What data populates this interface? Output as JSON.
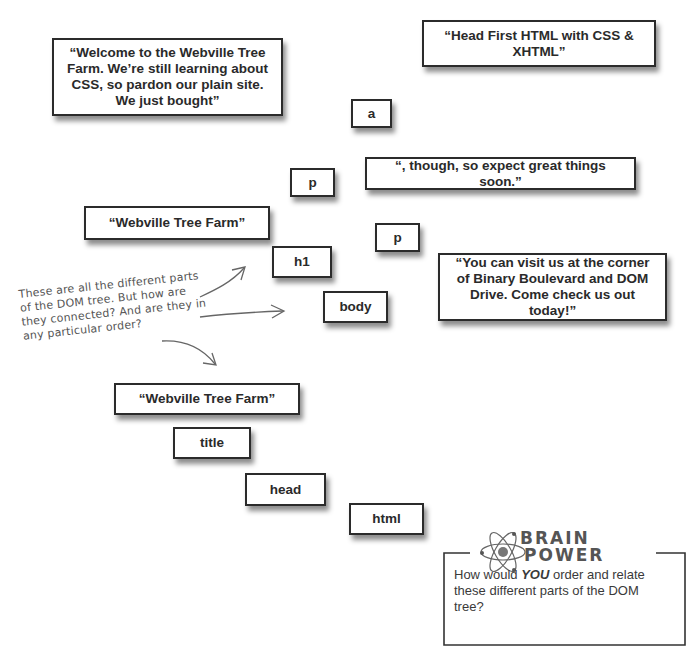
{
  "nodes": {
    "welcome_text": "“Welcome to the Webville Tree Farm. We’re still learning about CSS, so pardon our plain site. We just bought”",
    "book_text": "“Head First HTML with CSS & XHTML”",
    "a": "a",
    "though_text": "“, though, so expect great things soon.”",
    "p1": "p",
    "heading_text": "“Webville Tree Farm”",
    "p2": "p",
    "h1": "h1",
    "body": "body",
    "visit_text": "“You can visit us at the corner of Binary Boulevard and DOM Drive. Come check us out today!”",
    "title_text": "“Webville Tree Farm”",
    "title": "title",
    "head": "head",
    "html": "html"
  },
  "annotation": {
    "line1": "These are all the different parts",
    "line2": "of the DOM tree. But how are",
    "line3": "they connected? And are they in",
    "line4": "any particular order?"
  },
  "brain_power": {
    "title_line1": "BRAIN",
    "title_line2": "POWER",
    "icon": "atom-icon",
    "text_before": "How would ",
    "text_emph": "YOU",
    "text_after": " order and relate these different parts of the DOM tree?"
  },
  "colors": {
    "box_border": "#2b2b2b",
    "text": "#2a2a2a",
    "handwriting": "#555555",
    "background": "#ffffff"
  }
}
